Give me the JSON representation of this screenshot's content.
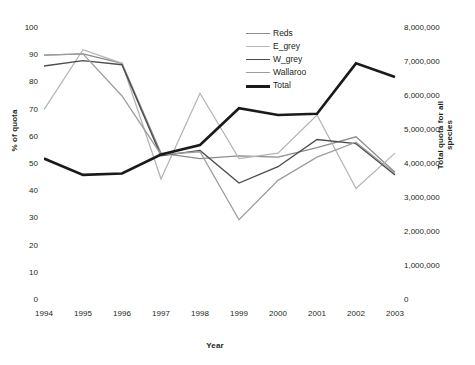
{
  "chart_data": {
    "type": "line",
    "title": "",
    "xlabel": "Year",
    "ylabel": "% of quota",
    "ylabel_secondary": "Total quota for all species",
    "x": [
      1994,
      1995,
      1996,
      1997,
      1998,
      1999,
      2000,
      2001,
      2002,
      2003
    ],
    "categories": [
      "1994",
      "1995",
      "1996",
      "1997",
      "1998",
      "1999",
      "2000",
      "2001",
      "2002",
      "2003"
    ],
    "xticklabels": [
      "1994",
      "1995",
      "1996",
      "1997",
      "1998",
      "1999",
      "2000",
      "2001",
      "2002",
      "2003"
    ],
    "yticklabels": [
      "0",
      "10",
      "20",
      "30",
      "40",
      "50",
      "60",
      "70",
      "80",
      "90",
      "100"
    ],
    "yticklabels_secondary": [
      "0",
      "1,000,000",
      "2,000,000",
      "3,000,000",
      "4,000,000",
      "5,000,000",
      "6,000,000",
      "7,000,000",
      "8,000,000"
    ],
    "ylim": [
      0,
      100
    ],
    "ylim_secondary": [
      0,
      8000000
    ],
    "yticks": [
      0,
      10,
      20,
      30,
      40,
      50,
      60,
      70,
      80,
      90,
      100
    ],
    "yticks_secondary": [
      0,
      1000000,
      2000000,
      3000000,
      4000000,
      5000000,
      6000000,
      7000000,
      8000000
    ],
    "grid": false,
    "legend_position": "top-right",
    "series": [
      {
        "name": "Reds",
        "axis": "left",
        "color": "#8c8c8c",
        "width": 1.3,
        "values": [
          90,
          90.5,
          87,
          54,
          52,
          53,
          52.5,
          56,
          60,
          47
        ]
      },
      {
        "name": "E_grey",
        "axis": "left",
        "color": "#b5b5b5",
        "width": 1.3,
        "values": [
          70,
          92,
          87,
          44.5,
          76,
          52,
          54,
          68,
          41,
          54
        ]
      },
      {
        "name": "W_grey",
        "axis": "left",
        "color": "#4d4d4d",
        "width": 1.4,
        "values": [
          86,
          88,
          86.5,
          53,
          55,
          43,
          49,
          59,
          57.5,
          46
        ]
      },
      {
        "name": "Wallaroo",
        "axis": "left",
        "color": "#9e9e9e",
        "width": 1.3,
        "values": [
          90,
          90.5,
          75,
          53.5,
          54.5,
          29.5,
          44,
          52.5,
          58,
          46.5
        ]
      },
      {
        "name": "Total",
        "axis": "right",
        "color": "#1a1a1a",
        "width": 2.6,
        "values_percent_scale": [
          52,
          46,
          46.5,
          53.5,
          57,
          70.5,
          68,
          68.5,
          87,
          82
        ],
        "values": [
          4160000,
          3680000,
          3720000,
          4280000,
          4560000,
          5640000,
          5440000,
          5480000,
          6960000,
          6560000
        ]
      }
    ]
  },
  "axes": {
    "left_title": "% of quota",
    "right_title": "Total quota for all species",
    "x_title": "Year"
  },
  "legend": {
    "items": [
      {
        "label": "Reds"
      },
      {
        "label": "E_grey"
      },
      {
        "label": "W_grey"
      },
      {
        "label": "Wallaroo"
      },
      {
        "label": "Total"
      }
    ]
  }
}
